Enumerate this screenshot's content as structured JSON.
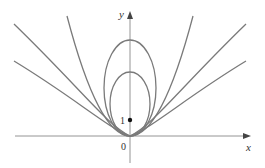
{
  "figure": {
    "axes": {
      "x_label": "x",
      "y_label": "y",
      "origin_label": "0",
      "focus_label": "1"
    },
    "curves": [
      {
        "type": "ellipse",
        "name": "inner ellipse"
      },
      {
        "type": "ellipse",
        "name": "outer ellipse"
      },
      {
        "type": "parabola",
        "name": "parabola"
      },
      {
        "type": "hyperbola",
        "name": "hyperbola 1"
      },
      {
        "type": "hyperbola",
        "name": "hyperbola 2"
      }
    ],
    "focus_point": {
      "x": 0,
      "y": 1
    },
    "colors": {
      "curve": "#7a7a7a",
      "axis": "#888888",
      "text": "#333333"
    }
  }
}
